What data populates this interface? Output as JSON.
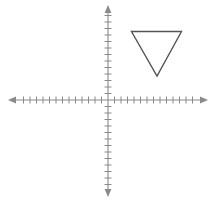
{
  "figure": {
    "title": "",
    "background_color": "#ffffff",
    "width": 214,
    "height": 203
  },
  "axes": {
    "axis_color": "#8a8a8a",
    "axis_stroke_width": 1.1,
    "tick_color": "#8a8a8a",
    "tick_stroke_width": 1.0,
    "origin": {
      "x": 108,
      "y": 100
    },
    "tick_spacing_px": 6.5,
    "tick_half_length_px": 3.5,
    "x_axis": {
      "name": "x-axis",
      "start_x": 13,
      "end_x": 203,
      "y": 100,
      "ticks_left": 13,
      "ticks_right": 13,
      "arrow_left": true,
      "arrow_right": true
    },
    "y_axis": {
      "name": "y-axis",
      "x": 108,
      "start_y": 10,
      "end_y": 192,
      "ticks_up": 13,
      "ticks_down": 13,
      "arrow_up": true,
      "arrow_down": true
    }
  },
  "shapes": [
    {
      "name": "triangle",
      "type": "polygon",
      "stroke_color": "#555555",
      "stroke_width": 1.4,
      "fill": "none",
      "vertices_px": [
        {
          "x": 131.5,
          "y": 31.5
        },
        {
          "x": 181.5,
          "y": 31.5
        },
        {
          "x": 157.0,
          "y": 76.0
        }
      ],
      "vertices_grid": [
        {
          "x": 3.6,
          "y": 10.5
        },
        {
          "x": 11.3,
          "y": 10.5
        },
        {
          "x": 7.5,
          "y": 3.7
        }
      ],
      "quadrant": "I",
      "orientation": "point-down"
    }
  ],
  "chart_data": {
    "type": "scatter",
    "title": "",
    "xlabel": "",
    "ylabel": "",
    "grid": false,
    "legend": null,
    "xlim": [
      -14.6,
      14.6
    ],
    "ylim": [
      -13.8,
      13.8
    ],
    "x_tick_count": 26,
    "y_tick_count": 26,
    "series": [
      {
        "name": "triangle",
        "shape": "polygon",
        "closed": true,
        "x": [
          3.6,
          11.3,
          7.5
        ],
        "y": [
          10.5,
          10.5,
          3.7
        ]
      }
    ],
    "annotations": []
  }
}
